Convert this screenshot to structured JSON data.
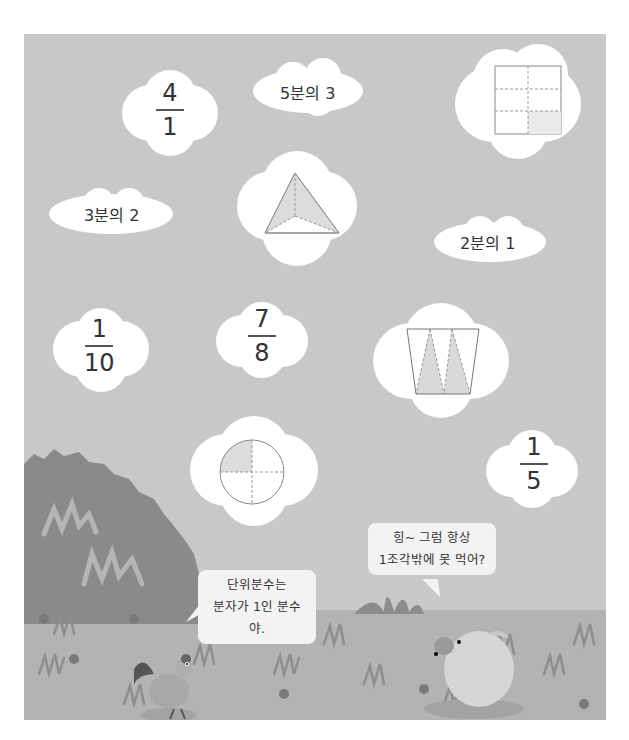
{
  "clouds": [
    {
      "id": "c1",
      "type": "fraction",
      "numerator": "4",
      "denominator": "1"
    },
    {
      "id": "c2",
      "type": "text",
      "text": "5분의 3"
    },
    {
      "id": "c3",
      "type": "shape",
      "shape": "rectangle-6-parts-1-shaded"
    },
    {
      "id": "c4",
      "type": "text",
      "text": "3분의 2"
    },
    {
      "id": "c5",
      "type": "shape",
      "shape": "triangle-3-parts-2-shaded"
    },
    {
      "id": "c6",
      "type": "text",
      "text": "2분의 1"
    },
    {
      "id": "c7",
      "type": "fraction",
      "numerator": "1",
      "denominator": "10"
    },
    {
      "id": "c8",
      "type": "fraction",
      "numerator": "7",
      "denominator": "8"
    },
    {
      "id": "c9",
      "type": "shape",
      "shape": "trapezoid-triangles-2-shaded"
    },
    {
      "id": "c10",
      "type": "shape",
      "shape": "circle-4-parts-1-shaded"
    },
    {
      "id": "c11",
      "type": "fraction",
      "numerator": "1",
      "denominator": "5"
    }
  ],
  "speech": {
    "rooster": {
      "line1": "단위분수는",
      "line2": "분자가 1인 분수야."
    },
    "pig": {
      "line1": "힝~ 그럼 항상",
      "line2": "1조각밖에 못 먹어?"
    }
  },
  "colors": {
    "sky": "#c8c8c8",
    "ground": "#b3b3b3",
    "bush": "#8a8a8a",
    "shade": "#d9d9d9"
  }
}
